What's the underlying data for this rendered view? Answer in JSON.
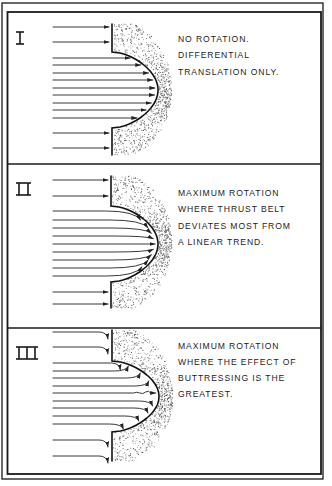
{
  "figure": {
    "width": 332,
    "height": 486,
    "colors": {
      "ink": "#1a1a1a",
      "paper": "#ffffff",
      "stipple": "#555555"
    },
    "outer_frame": {
      "x": 2,
      "y": 3,
      "w": 321,
      "h": 476
    },
    "inner_frame": {
      "x": 7.5,
      "y": 12,
      "w": 313.5,
      "h": 462
    },
    "dividers_y": [
      164,
      328
    ]
  },
  "panels": [
    {
      "id": "I",
      "numeral": "I",
      "numeral_strokes": 1,
      "top": 12,
      "text_lines": [
        "NO ROTATION.",
        "DIFFERENTIAL",
        "TRANSLATION ONLY."
      ],
      "text_x": 178,
      "text_y": [
        42,
        58,
        75
      ],
      "behavior": "straight",
      "front": {
        "x_base": 112,
        "x_peak": 158,
        "y_top": 24,
        "y_peak": 90,
        "y_bottom": 155,
        "y_start_bulge": 52,
        "y_end_bulge": 128
      },
      "arrows_y": [
        27,
        42,
        58,
        65,
        73,
        80,
        88,
        95,
        103,
        110,
        118,
        133,
        148
      ]
    },
    {
      "id": "II",
      "numeral": "II",
      "numeral_strokes": 2,
      "top": 164,
      "text_lines": [
        "MAXIMUM ROTATION",
        "WHERE THRUST BELT",
        "DEVIATES MOST FROM",
        "A LINEAR TREND."
      ],
      "text_x": 178,
      "text_y": [
        196,
        212,
        229,
        245
      ],
      "behavior": "curve-outward",
      "front": {
        "x_base": 111,
        "x_peak": 158,
        "y_top": 176,
        "y_peak": 244,
        "y_bottom": 308,
        "y_start_bulge": 206,
        "y_end_bulge": 282
      },
      "arrows_y": [
        180,
        196,
        211,
        220,
        228,
        236,
        244,
        252,
        260,
        268,
        276,
        292,
        304
      ]
    },
    {
      "id": "III",
      "numeral": "III",
      "numeral_strokes": 3,
      "top": 328,
      "text_lines": [
        "MAXIMUM ROTATION",
        "WHERE THE EFFECT OF",
        "BUTTRESSING IS THE",
        "GREATEST."
      ],
      "text_x": 178,
      "text_y": [
        349,
        365,
        381,
        397
      ],
      "behavior": "curve-down",
      "front": {
        "x_base": 112,
        "x_peak": 159,
        "y_top": 330,
        "y_peak": 393,
        "y_bottom": 461,
        "y_start_bulge": 361,
        "y_end_bulge": 432
      },
      "arrows_y": [
        332,
        347,
        363,
        371,
        378,
        386,
        393,
        401,
        408,
        416,
        424,
        440,
        456
      ]
    }
  ],
  "arrow_start_x": 53
}
